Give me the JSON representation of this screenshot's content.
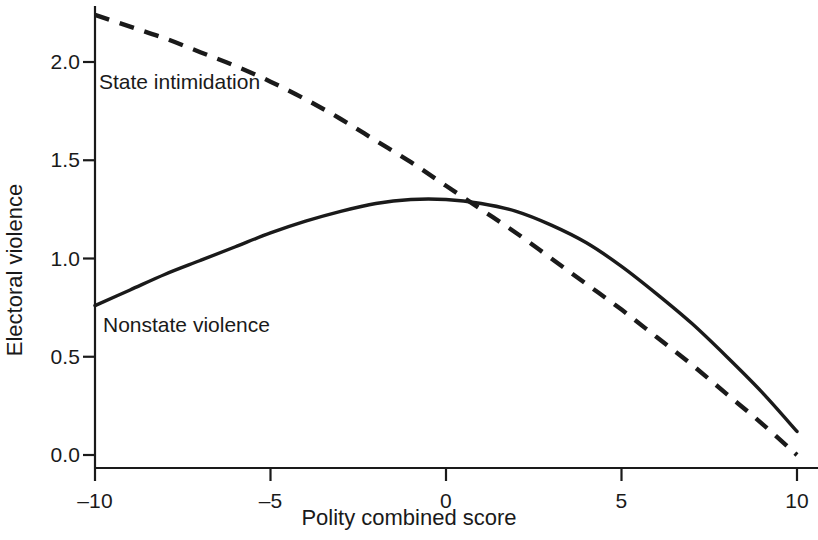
{
  "chart_data": {
    "type": "line",
    "title": "",
    "xlabel": "Polity combined score",
    "ylabel": "Electoral violence",
    "xlim": [
      -10,
      10
    ],
    "ylim": [
      0.0,
      2.3
    ],
    "xticks": [
      -10,
      -5,
      0,
      5,
      10
    ],
    "xtick_labels": [
      "–10",
      "–5",
      "0",
      "5",
      "10"
    ],
    "yticks": [
      0.0,
      0.5,
      1.0,
      1.5,
      2.0
    ],
    "ytick_labels": [
      "0.0",
      "0.5",
      "1.0",
      "1.5",
      "2.0"
    ],
    "grid": false,
    "legend_position": "inline-annotation",
    "axis_color": "#1a1a1a",
    "series": [
      {
        "name": "State intimidation",
        "style": "dashed",
        "color": "#1a1a1a",
        "label_x": -9.5,
        "label_y": 1.93,
        "x": [
          -10,
          -9,
          -8,
          -7,
          -6,
          -5,
          -4,
          -3,
          -2,
          -1,
          0,
          1,
          2,
          3,
          4,
          5,
          6,
          7,
          8,
          9,
          10
        ],
        "values": [
          2.24,
          2.18,
          2.12,
          2.05,
          1.98,
          1.9,
          1.81,
          1.71,
          1.6,
          1.49,
          1.37,
          1.25,
          1.13,
          1.0,
          0.87,
          0.74,
          0.6,
          0.46,
          0.31,
          0.16,
          0.0
        ]
      },
      {
        "name": "Nonstate violence",
        "style": "solid",
        "color": "#1a1a1a",
        "label_x": -9.3,
        "label_y": 0.63,
        "x": [
          -10,
          -9,
          -8,
          -7,
          -6,
          -5,
          -4,
          -3,
          -2,
          -1,
          0,
          1,
          2,
          3,
          4,
          5,
          6,
          7,
          8,
          9,
          10
        ],
        "values": [
          0.76,
          0.84,
          0.92,
          0.99,
          1.06,
          1.13,
          1.19,
          1.24,
          1.28,
          1.3,
          1.3,
          1.28,
          1.24,
          1.17,
          1.08,
          0.96,
          0.82,
          0.67,
          0.5,
          0.32,
          0.12
        ]
      }
    ],
    "annotations": [
      {
        "text": "State intimidation",
        "series": "State intimidation"
      },
      {
        "text": "Nonstate violence",
        "series": "Nonstate violence"
      }
    ]
  }
}
